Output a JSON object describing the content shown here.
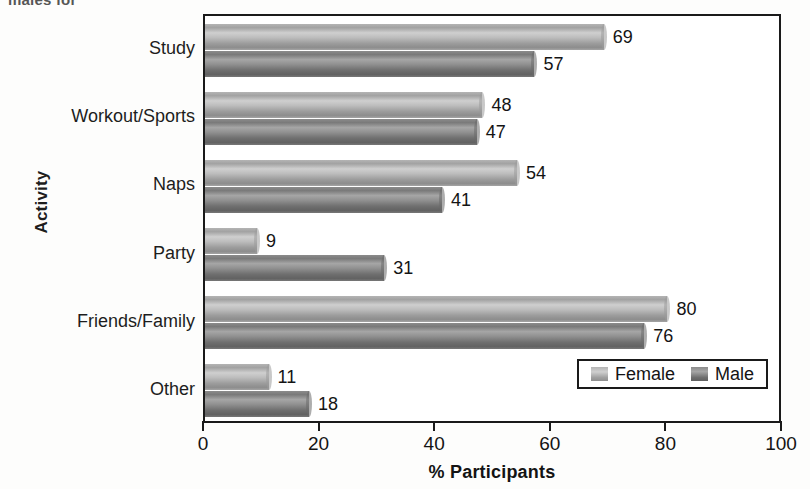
{
  "page": {
    "top_caption_remnant": "males for"
  },
  "chart_data": {
    "type": "bar",
    "orientation": "horizontal",
    "title": "",
    "xlabel": "% Participants",
    "ylabel": "Activity",
    "xlim": [
      0,
      100
    ],
    "xticks": [
      0,
      20,
      40,
      60,
      80,
      100
    ],
    "xtick_labels": [
      "0",
      "20",
      "40",
      "60",
      "80",
      "100"
    ],
    "grid": false,
    "legend_position": "lower right",
    "categories": [
      "Study",
      "Workout/Sports",
      "Naps",
      "Party",
      "Friends/Family",
      "Other"
    ],
    "series": [
      {
        "name": "Female",
        "color": "#b0b0b0",
        "values": [
          69,
          48,
          54,
          9,
          80,
          11
        ],
        "value_labels": [
          "69",
          "48",
          "54",
          "9",
          "80",
          "11"
        ]
      },
      {
        "name": "Male",
        "color": "#767676",
        "values": [
          57,
          47,
          41,
          31,
          76,
          18
        ],
        "value_labels": [
          "57",
          "47",
          "41",
          "31",
          "76",
          "18"
        ]
      }
    ]
  },
  "legend": {
    "items": [
      {
        "label": "Female"
      },
      {
        "label": "Male"
      }
    ]
  },
  "colors": {
    "axis": "#1a1a1a",
    "text": "#141414",
    "female_bar": "#b0b0b0",
    "male_bar": "#767676",
    "plot_background": "#ffffff"
  }
}
